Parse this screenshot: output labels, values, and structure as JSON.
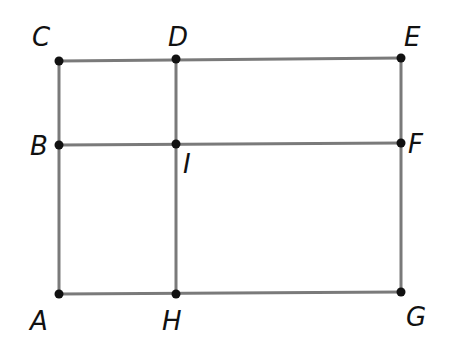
{
  "diagram": {
    "type": "geometry-figure",
    "line_color": "#7a7a7a",
    "point_color": "#111111",
    "points": [
      {
        "id": "C",
        "label": "C",
        "x": 59,
        "y": 61,
        "lx": 32,
        "ly": 46
      },
      {
        "id": "D",
        "label": "D",
        "x": 176,
        "y": 59,
        "lx": 168,
        "ly": 46
      },
      {
        "id": "E",
        "label": "E",
        "x": 401,
        "y": 58,
        "lx": 404,
        "ly": 46
      },
      {
        "id": "B",
        "label": "B",
        "x": 59,
        "y": 145,
        "lx": 30,
        "ly": 155
      },
      {
        "id": "I",
        "label": "I",
        "x": 176,
        "y": 144,
        "lx": 183,
        "ly": 173
      },
      {
        "id": "F",
        "label": "F",
        "x": 401,
        "y": 143,
        "lx": 408,
        "ly": 153
      },
      {
        "id": "A",
        "label": "A",
        "x": 59,
        "y": 294,
        "lx": 30,
        "ly": 330
      },
      {
        "id": "H",
        "label": "H",
        "x": 176,
        "y": 294,
        "lx": 162,
        "ly": 330
      },
      {
        "id": "G",
        "label": "G",
        "x": 401,
        "y": 292,
        "lx": 406,
        "ly": 326
      }
    ],
    "segments": [
      [
        "C",
        "E"
      ],
      [
        "B",
        "F"
      ],
      [
        "A",
        "G"
      ],
      [
        "C",
        "A"
      ],
      [
        "D",
        "H"
      ],
      [
        "E",
        "G"
      ]
    ]
  }
}
